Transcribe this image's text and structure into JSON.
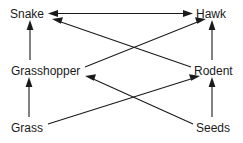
{
  "diagram": {
    "type": "food-web",
    "background_color": "#ffffff",
    "line_color": "#1a1a1a",
    "text_color": "#1a1a1a",
    "nodes": [
      {
        "id": "snake",
        "label": "Snake",
        "x": 10,
        "y": 8,
        "trophic_level": "predator",
        "position": "top-left"
      },
      {
        "id": "hawk",
        "label": "Hawk",
        "x": 196,
        "y": 8,
        "trophic_level": "predator",
        "position": "top-right"
      },
      {
        "id": "grasshopper",
        "label": "Grasshopper",
        "x": 11,
        "y": 65,
        "trophic_level": "consumer",
        "position": "middle-left"
      },
      {
        "id": "rodent",
        "label": "Rodent",
        "x": 194,
        "y": 65,
        "trophic_level": "consumer",
        "position": "middle-right"
      },
      {
        "id": "grass",
        "label": "Grass",
        "x": 11,
        "y": 122,
        "trophic_level": "producer",
        "position": "bottom-left"
      },
      {
        "id": "seeds",
        "label": "Seeds",
        "x": 196,
        "y": 122,
        "trophic_level": "producer",
        "position": "bottom-right"
      }
    ],
    "edges": [
      {
        "id": "snake-hawk",
        "from": "Snake",
        "to": "Hawk",
        "direction": "bidirectional",
        "style": "horizontal"
      },
      {
        "id": "grasshopper-snake",
        "from": "Grasshopper",
        "to": "Snake",
        "direction": "one-way",
        "style": "vertical"
      },
      {
        "id": "rodent-hawk",
        "from": "Rodent",
        "to": "Hawk",
        "direction": "one-way",
        "style": "vertical"
      },
      {
        "id": "grass-grasshopper",
        "from": "Grass",
        "to": "Grasshopper",
        "direction": "one-way",
        "style": "vertical"
      },
      {
        "id": "seeds-rodent",
        "from": "Seeds",
        "to": "Rodent",
        "direction": "one-way",
        "style": "vertical"
      },
      {
        "id": "rodent-snake",
        "from": "Rodent",
        "to": "Snake",
        "direction": "one-way",
        "style": "diagonal"
      },
      {
        "id": "grasshopper-hawk",
        "from": "Grasshopper",
        "to": "Hawk",
        "direction": "one-way",
        "style": "diagonal"
      },
      {
        "id": "grass-rodent",
        "from": "Grass",
        "to": "Rodent",
        "direction": "one-way",
        "style": "diagonal"
      },
      {
        "id": "seeds-grasshopper",
        "from": "Seeds",
        "to": "Grasshopper",
        "direction": "one-way",
        "style": "diagonal"
      }
    ]
  }
}
